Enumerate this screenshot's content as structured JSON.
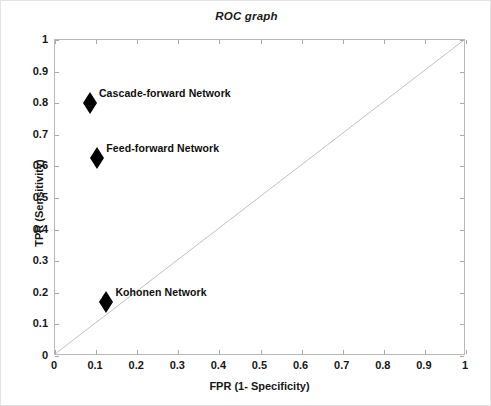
{
  "chart_data": {
    "type": "scatter",
    "title": "ROC graph",
    "xlabel": "FPR (1- Specificity)",
    "ylabel": "TPR (Sensitivity)",
    "xlim": [
      0,
      1
    ],
    "ylim": [
      0,
      1
    ],
    "grid": false,
    "legend": "none (points annotated inline)",
    "xticks": [
      "0",
      "0.1",
      "0.2",
      "0.3",
      "0.4",
      "0.5",
      "0.6",
      "0.7",
      "0.8",
      "0.9",
      "1"
    ],
    "yticks": [
      "0",
      "0.1",
      "0.2",
      "0.3",
      "0.4",
      "0.5",
      "0.6",
      "0.7",
      "0.8",
      "0.9",
      "1"
    ],
    "xtick_values": [
      0,
      0.1,
      0.2,
      0.3,
      0.4,
      0.5,
      0.6,
      0.7,
      0.8,
      0.9,
      1
    ],
    "ytick_values": [
      0,
      0.1,
      0.2,
      0.3,
      0.4,
      0.5,
      0.6,
      0.7,
      0.8,
      0.9,
      1
    ],
    "points": [
      {
        "label": "Cascade-forward Network",
        "x": 0.085,
        "y": 0.8,
        "marker": "filled-diamond",
        "color": "#000000"
      },
      {
        "label": "Feed-forward  Network",
        "x": 0.103,
        "y": 0.628,
        "marker": "filled-diamond",
        "color": "#000000"
      },
      {
        "label": "Kohonen Network",
        "x": 0.125,
        "y": 0.172,
        "marker": "filled-diamond",
        "color": "#000000"
      }
    ],
    "reference_line": {
      "name": "chance diagonal",
      "from": [
        0,
        0
      ],
      "to": [
        1,
        1
      ],
      "color": "#c0c0c0"
    },
    "colors": {
      "axis": "#b9b9b9",
      "tick": "#a8a8a8",
      "text": "#161616",
      "marker": "#000000",
      "diagonal": "#c0c0c0",
      "background": "#ffffff"
    }
  }
}
